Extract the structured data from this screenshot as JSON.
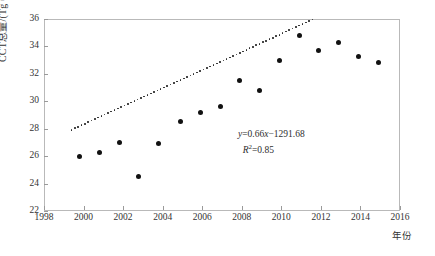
{
  "chart_data": {
    "type": "scatter",
    "title": "",
    "xlabel": "年份",
    "ylabel": "CCT总量/(Tg C/a)",
    "xlim": [
      1998,
      2016
    ],
    "ylim": [
      22,
      36
    ],
    "xticks": [
      1998,
      2000,
      2002,
      2004,
      2006,
      2008,
      2010,
      2012,
      2014,
      2016
    ],
    "yticks": [
      22,
      24,
      26,
      28,
      30,
      32,
      34,
      36
    ],
    "grid": false,
    "legend": "none",
    "series": [
      {
        "name": "CCT总量",
        "x": [
          1999.8,
          2000.8,
          2001.8,
          2002.8,
          2003.8,
          2004.9,
          2005.9,
          2006.9,
          2007.9,
          2008.9,
          2009.9,
          2010.9,
          2011.9,
          2012.9,
          2013.9,
          2014.9
        ],
        "values": [
          26.0,
          26.3,
          27.0,
          24.5,
          26.9,
          28.5,
          29.2,
          29.6,
          31.5,
          30.8,
          33.0,
          34.8,
          33.7,
          34.3,
          33.3,
          32.8
        ]
      }
    ],
    "trendline": {
      "equation": "y=0.66x−1291.68",
      "r2_label": "R2=0.85",
      "slope": 0.66,
      "intercept": -1291.68,
      "r_squared": 0.85,
      "style": "dotted",
      "x_start": 1999.4,
      "x_end": 2015.4
    },
    "annotations": [
      {
        "name": "regression-equation",
        "text": "y=0.66x−1291.68"
      },
      {
        "name": "r-squared",
        "text": "R2=0.85"
      }
    ]
  },
  "axis": {
    "y_title": "CCT总量/(Tg C/a)",
    "x_title": "年份",
    "y_tick_labels": [
      "36",
      "34",
      "32",
      "30",
      "28",
      "26",
      "24",
      "22"
    ],
    "x_tick_labels": [
      "1998",
      "2000",
      "2002",
      "2004",
      "2006",
      "2008",
      "2010",
      "2012",
      "2014",
      "2016"
    ]
  },
  "equation": {
    "line1_y": "y",
    "line1_rest": "=0.66",
    "line1_x": "x",
    "line1_tail": "−1291.68",
    "line2_r": "R",
    "line2_sup": "2",
    "line2_rest": "=0.85"
  },
  "colors": {
    "point": "#111111",
    "trend": "#222222",
    "frame": "#b9b9b9",
    "text": "#333333",
    "background": "#ffffff"
  }
}
